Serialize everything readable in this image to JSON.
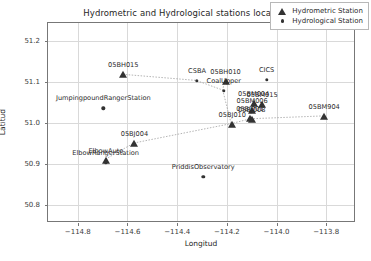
{
  "chart_data": {
    "type": "scatter",
    "title": "Hydrometric and Hydrological stations location",
    "xlabel": "Longitud",
    "ylabel": "Latitud",
    "xlim": [
      -114.92,
      -113.68
    ],
    "ylim": [
      50.755,
      51.245
    ],
    "xticks": [
      -114.8,
      -114.6,
      -114.4,
      -114.2,
      -114.0,
      -113.8
    ],
    "xticklabels": [
      "−114.8",
      "−114.6",
      "−114.4",
      "−114.2",
      "−114.0",
      "−113.8"
    ],
    "yticks": [
      50.8,
      50.9,
      51.0,
      51.1,
      51.2
    ],
    "yticklabels": [
      "50.8",
      "50.9",
      "51.0",
      "51.1",
      "51.2"
    ],
    "grid": true,
    "legend_position": "upper right",
    "legend": [
      {
        "label": "Hydrometric Station",
        "marker": "triangle"
      },
      {
        "label": "Hydrological Station",
        "marker": "circle"
      }
    ],
    "series": [
      {
        "name": "Hydrometric Station",
        "marker": "triangle",
        "color": "#333333",
        "points": [
          {
            "label": "05BH015",
            "x": -114.617,
            "y": 51.118
          },
          {
            "label": "05BH010",
            "x": -114.205,
            "y": 51.1
          },
          {
            "label": "05BM015",
            "x": -114.058,
            "y": 51.043
          },
          {
            "label": "05BM004",
            "x": -114.092,
            "y": 51.046
          },
          {
            "label": "05BM006",
            "x": -114.098,
            "y": 51.03
          },
          {
            "label": "05BJ001",
            "x": -114.107,
            "y": 51.011
          },
          {
            "label": "05BJ008",
            "x": -114.1,
            "y": 51.008
          },
          {
            "label": "05BJ010",
            "x": -114.178,
            "y": 50.996
          },
          {
            "label": "05BM904",
            "x": -113.808,
            "y": 51.015
          },
          {
            "label": "05BJ004",
            "x": -114.572,
            "y": 50.948
          },
          {
            "label": "ElbowAuto",
            "x": -114.687,
            "y": 50.908
          }
        ]
      },
      {
        "name": "Hydrological Station",
        "marker": "circle",
        "color": "#333333",
        "points": [
          {
            "label": "CSBA",
            "x": -114.32,
            "y": 51.103
          },
          {
            "label": "CoalUpper",
            "x": -114.212,
            "y": 51.079
          },
          {
            "label": "CICS",
            "x": -114.04,
            "y": 51.106
          },
          {
            "label": "JumpingpoundRangerStation",
            "x": -114.697,
            "y": 51.036
          },
          {
            "label": "ElbowRangerStation",
            "x": -114.688,
            "y": 50.903
          },
          {
            "label": "PriddisObservatory",
            "x": -114.295,
            "y": 50.868
          }
        ]
      }
    ],
    "connector_paths": [
      [
        [
          -114.617,
          51.118
        ],
        [
          -114.32,
          51.103
        ],
        [
          -114.212,
          51.079
        ],
        [
          -114.205,
          51.1
        ]
      ],
      [
        [
          -114.212,
          51.079
        ],
        [
          -114.178,
          50.996
        ]
      ],
      [
        [
          -114.572,
          50.948
        ],
        [
          -114.178,
          50.996
        ],
        [
          -114.1,
          51.008
        ],
        [
          -113.808,
          51.015
        ]
      ],
      [
        [
          -114.687,
          50.908
        ],
        [
          -114.572,
          50.948
        ]
      ]
    ]
  }
}
